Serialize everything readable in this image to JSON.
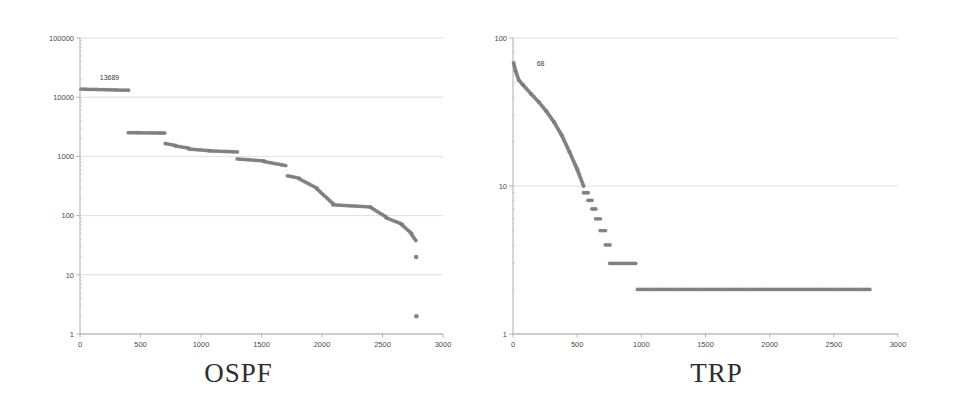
{
  "figure": {
    "background_color": "#ffffff",
    "marker_color": "#7d7d7d",
    "axis_color": "#9a9a9a",
    "grid_color": "#c9c9c9",
    "panels": [
      "ospf",
      "trp"
    ]
  },
  "panels": {
    "ospf": {
      "title": "OSPF",
      "annotation": "13689",
      "x_ticks": [
        "0",
        "500",
        "1000",
        "1500",
        "2000",
        "2500",
        "3000"
      ],
      "y_ticks": [
        "1",
        "10",
        "100",
        "1000",
        "10000",
        "100000"
      ]
    },
    "trp": {
      "title": "TRP",
      "annotation": "68",
      "x_ticks": [
        "0",
        "500",
        "1000",
        "1500",
        "2000",
        "2500",
        "3000"
      ],
      "y_ticks": [
        "1",
        "10",
        "100"
      ]
    }
  },
  "chart_data": [
    {
      "type": "scatter",
      "title": "OSPF",
      "xlabel": "",
      "ylabel": "",
      "yscale": "log",
      "xlim": [
        0,
        3000
      ],
      "ylim": [
        1,
        100000
      ],
      "grid": true,
      "legend": "none",
      "x_ticks": [
        0,
        500,
        1000,
        1500,
        2000,
        2500,
        3000
      ],
      "y_ticks": [
        1,
        10,
        100,
        1000,
        10000,
        100000
      ],
      "annotations": [
        {
          "text": "13689",
          "x": 230,
          "y": 13689,
          "describes": "maximum plateau value"
        }
      ],
      "description": "Rank-ordered (descending) step plot of per-node counts on a log y axis; flat plateaus joined by drops, ending in two isolated low outliers.",
      "segments": [
        {
          "x_start": 10,
          "x_end": 400,
          "y_start": 13689,
          "y_end": 13100
        },
        {
          "x_start": 400,
          "x_end": 700,
          "y_start": 2520,
          "y_end": 2480,
          "gap_before": true
        },
        {
          "x_start": 705,
          "x_end": 790,
          "y_start": 1650,
          "y_end": 1530
        },
        {
          "x_start": 790,
          "x_end": 900,
          "y_start": 1500,
          "y_end": 1380
        },
        {
          "x_start": 900,
          "x_end": 1070,
          "y_start": 1330,
          "y_end": 1250
        },
        {
          "x_start": 1070,
          "x_end": 1300,
          "y_start": 1240,
          "y_end": 1190
        },
        {
          "x_start": 1300,
          "x_end": 1520,
          "y_start": 905,
          "y_end": 840
        },
        {
          "x_start": 1520,
          "x_end": 1700,
          "y_start": 820,
          "y_end": 700
        },
        {
          "x_start": 1715,
          "x_end": 1810,
          "y_start": 470,
          "y_end": 430
        },
        {
          "x_start": 1810,
          "x_end": 1960,
          "y_start": 420,
          "y_end": 290
        },
        {
          "x_start": 1960,
          "x_end": 2090,
          "y_start": 280,
          "y_end": 160
        },
        {
          "x_start": 2090,
          "x_end": 2400,
          "y_start": 152,
          "y_end": 140
        },
        {
          "x_start": 2400,
          "x_end": 2530,
          "y_start": 138,
          "y_end": 95
        },
        {
          "x_start": 2530,
          "x_end": 2660,
          "y_start": 92,
          "y_end": 72
        },
        {
          "x_start": 2660,
          "x_end": 2740,
          "y_start": 70,
          "y_end": 50
        },
        {
          "x_start": 2740,
          "x_end": 2775,
          "y_start": 48,
          "y_end": 38
        }
      ],
      "outliers": [
        {
          "x": 2778,
          "y": 20
        },
        {
          "x": 2780,
          "y": 2
        }
      ],
      "approx_point_count": 2780
    },
    {
      "type": "scatter",
      "title": "TRP",
      "xlabel": "",
      "ylabel": "",
      "yscale": "log",
      "xlim": [
        0,
        3000
      ],
      "ylim": [
        1,
        100
      ],
      "grid": true,
      "legend": "none",
      "x_ticks": [
        0,
        500,
        1000,
        1500,
        2000,
        2500,
        3000
      ],
      "y_ticks": [
        1,
        10,
        100
      ],
      "annotations": [
        {
          "text": "68",
          "x": 60,
          "y": 68,
          "describes": "maximum value"
        }
      ],
      "description": "Rank-ordered (descending) plot on a log y axis: smooth convex decay from 68 down to about 10 near rank 550, then integer-valued steps 9,8,7,6,5,4,3 and a long flat plateau at 2 out to rank ~2780.",
      "segments": [
        {
          "x_start": 5,
          "x_end": 20,
          "y_start": 68,
          "y_end": 60
        },
        {
          "x_start": 20,
          "x_end": 45,
          "y_start": 60,
          "y_end": 52
        },
        {
          "x_start": 45,
          "x_end": 80,
          "y_start": 52,
          "y_end": 48
        },
        {
          "x_start": 80,
          "x_end": 140,
          "y_start": 48,
          "y_end": 42
        },
        {
          "x_start": 140,
          "x_end": 200,
          "y_start": 42,
          "y_end": 37
        },
        {
          "x_start": 200,
          "x_end": 260,
          "y_start": 37,
          "y_end": 32
        },
        {
          "x_start": 260,
          "x_end": 320,
          "y_start": 32,
          "y_end": 27
        },
        {
          "x_start": 320,
          "x_end": 380,
          "y_start": 27,
          "y_end": 22
        },
        {
          "x_start": 380,
          "x_end": 440,
          "y_start": 22,
          "y_end": 17
        },
        {
          "x_start": 440,
          "x_end": 500,
          "y_start": 17,
          "y_end": 13
        },
        {
          "x_start": 500,
          "x_end": 550,
          "y_start": 13,
          "y_end": 10
        },
        {
          "x_start": 550,
          "x_end": 585,
          "y_start": 9,
          "y_end": 9
        },
        {
          "x_start": 585,
          "x_end": 615,
          "y_start": 8,
          "y_end": 8
        },
        {
          "x_start": 615,
          "x_end": 645,
          "y_start": 7,
          "y_end": 7
        },
        {
          "x_start": 645,
          "x_end": 680,
          "y_start": 6,
          "y_end": 6
        },
        {
          "x_start": 680,
          "x_end": 720,
          "y_start": 5,
          "y_end": 5
        },
        {
          "x_start": 720,
          "x_end": 755,
          "y_start": 4,
          "y_end": 4
        },
        {
          "x_start": 755,
          "x_end": 955,
          "y_start": 3,
          "y_end": 3
        },
        {
          "x_start": 970,
          "x_end": 2780,
          "y_start": 2,
          "y_end": 2
        }
      ],
      "outliers": [],
      "approx_point_count": 2780
    }
  ]
}
